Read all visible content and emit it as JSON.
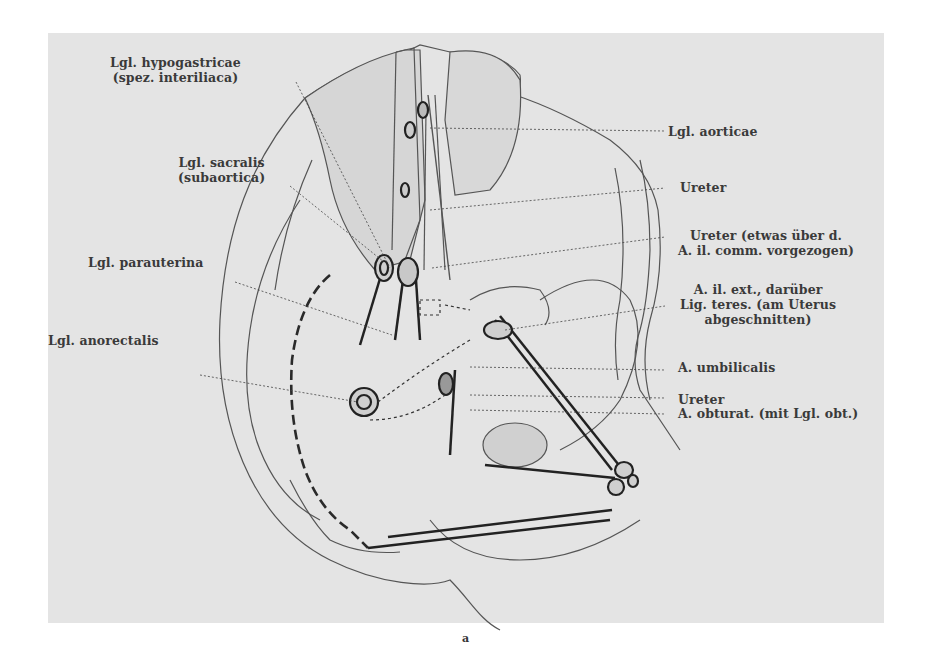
{
  "figure": {
    "caption": "a",
    "background_color": "#e4e4e4",
    "ink_color": "#333333",
    "labels_left": [
      {
        "id": "lgl-hypogastricae",
        "lines": [
          "Lgl. hypogastricae",
          "(spez. interiliaca)"
        ]
      },
      {
        "id": "lgl-sacralis",
        "lines": [
          "Lgl. sacralis",
          "(subaortica)"
        ]
      },
      {
        "id": "lgl-parauterina",
        "lines": [
          "Lgl. parauterina"
        ]
      },
      {
        "id": "lgl-anorectalis",
        "lines": [
          "Lgl. anorectalis"
        ]
      }
    ],
    "labels_right": [
      {
        "id": "lgl-aorticae",
        "lines": [
          "Lgl. aorticae"
        ]
      },
      {
        "id": "ureter-upper",
        "lines": [
          "Ureter"
        ]
      },
      {
        "id": "ureter-ilcomm",
        "lines": [
          "Ureter (etwas über d.",
          "A. il. comm. vorgezogen)"
        ]
      },
      {
        "id": "a-il-ext",
        "lines": [
          "A. il. ext., darüber",
          "Lig. teres. (am Uterus",
          "abgeschnitten)"
        ]
      },
      {
        "id": "a-umbilicalis",
        "lines": [
          "A. umbilicalis"
        ]
      },
      {
        "id": "ureter-lower",
        "lines": [
          "Ureter"
        ]
      },
      {
        "id": "a-obturat",
        "lines": [
          "A. obturat. (mit Lgl. obt.)"
        ]
      }
    ]
  }
}
